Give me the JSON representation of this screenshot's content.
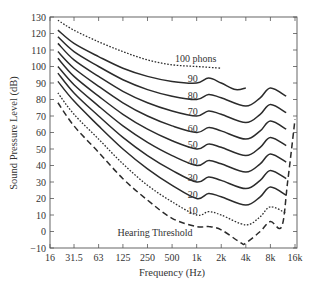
{
  "chart_data": {
    "type": "line",
    "title": "",
    "xlabel": "Frequency (Hz)",
    "ylabel": "Sound Pressure Level (dB)",
    "xscale": "log2",
    "x_ticks": [
      "16",
      "31.5",
      "63",
      "125",
      "250",
      "500",
      "1k",
      "2k",
      "4k",
      "8k",
      "16k"
    ],
    "x_tick_values": [
      16,
      31.5,
      63,
      125,
      250,
      500,
      1000,
      2000,
      4000,
      8000,
      16000
    ],
    "y_ticks": [
      130,
      120,
      110,
      100,
      90,
      80,
      70,
      60,
      50,
      40,
      30,
      20,
      10,
      0,
      -10
    ],
    "ylim": [
      -10,
      130
    ],
    "xlim": [
      16,
      16000
    ],
    "grid": false,
    "legend": "inline labels",
    "annotations": [
      {
        "text": "100 phons",
        "x": 2000,
        "y": 104
      },
      {
        "text": "Hearing Threshold",
        "x": 700,
        "y": -4
      }
    ],
    "series": [
      {
        "name": "100 phons",
        "label": "100 phons",
        "style": "dotted",
        "x": [
          20,
          31.5,
          63,
          125,
          250,
          500,
          1000,
          2000
        ],
        "values": [
          128,
          122,
          115,
          109,
          104,
          101,
          100,
          99
        ]
      },
      {
        "name": "90 phons",
        "label": "90",
        "style": "solid",
        "x": [
          20,
          31.5,
          63,
          125,
          250,
          500,
          1000,
          1400,
          2000,
          3000,
          4000
        ],
        "values": [
          122,
          114,
          106,
          99,
          94,
          91,
          90,
          93,
          90,
          86,
          87
        ]
      },
      {
        "name": "80 phons",
        "label": "80",
        "style": "solid",
        "x": [
          20,
          31.5,
          63,
          125,
          250,
          500,
          1000,
          1400,
          2000,
          4000,
          6000,
          8000,
          12500
        ],
        "values": [
          118,
          109,
          100,
          92,
          86,
          82,
          80,
          83,
          81,
          76,
          81,
          87,
          82
        ]
      },
      {
        "name": "70 phons",
        "label": "70",
        "style": "solid",
        "x": [
          20,
          31.5,
          63,
          125,
          250,
          500,
          1000,
          1400,
          2000,
          4000,
          6000,
          8000,
          12500
        ],
        "values": [
          114,
          104,
          94,
          85,
          78,
          73,
          70,
          73,
          71,
          66,
          71,
          77,
          72
        ]
      },
      {
        "name": "60 phons",
        "label": "60",
        "style": "solid",
        "x": [
          20,
          31.5,
          63,
          125,
          250,
          500,
          1000,
          1400,
          2000,
          4000,
          6000,
          8000,
          12500
        ],
        "values": [
          109,
          99,
          88,
          78,
          70,
          64,
          60,
          63,
          61,
          56,
          61,
          67,
          62
        ]
      },
      {
        "name": "50 phons",
        "label": "50",
        "style": "solid",
        "x": [
          20,
          31.5,
          63,
          125,
          250,
          500,
          1000,
          1400,
          2000,
          4000,
          6000,
          8000,
          12500
        ],
        "values": [
          105,
          94,
          82,
          71,
          62,
          55,
          50,
          53,
          51,
          46,
          51,
          57,
          52
        ]
      },
      {
        "name": "40 phons",
        "label": "40",
        "style": "solid",
        "x": [
          20,
          31.5,
          63,
          125,
          250,
          500,
          1000,
          1400,
          2000,
          4000,
          6000,
          8000,
          12500
        ],
        "values": [
          100,
          89,
          76,
          64,
          54,
          46,
          40,
          43,
          41,
          36,
          41,
          47,
          42
        ]
      },
      {
        "name": "30 phons",
        "label": "30",
        "style": "solid",
        "x": [
          20,
          31.5,
          63,
          125,
          250,
          500,
          1000,
          1400,
          2000,
          4000,
          6000,
          8000,
          12500
        ],
        "values": [
          96,
          84,
          70,
          57,
          46,
          37,
          30,
          33,
          31,
          26,
          31,
          37,
          32
        ]
      },
      {
        "name": "20 phons",
        "label": "20",
        "style": "solid",
        "x": [
          20,
          31.5,
          63,
          125,
          250,
          500,
          1000,
          1400,
          2000,
          4000,
          6000,
          8000,
          12500
        ],
        "values": [
          91,
          79,
          64,
          50,
          38,
          28,
          20,
          23,
          21,
          16,
          21,
          27,
          22
        ]
      },
      {
        "name": "10 phons",
        "label": "10",
        "style": "dotted",
        "x": [
          20,
          31.5,
          63,
          125,
          250,
          500,
          1000,
          1400,
          2000,
          4000,
          6000,
          8000,
          12500
        ],
        "values": [
          84,
          71,
          56,
          41,
          28,
          18,
          10,
          12,
          10,
          4,
          9,
          15,
          11
        ]
      },
      {
        "name": "Hearing Threshold",
        "label": "Hearing Threshold",
        "style": "dashed",
        "x": [
          20,
          31.5,
          63,
          125,
          250,
          500,
          1000,
          1400,
          2000,
          3500,
          4000,
          6000,
          8000,
          11000,
          13000,
          16000
        ],
        "values": [
          78,
          64,
          48,
          32,
          19,
          8,
          3,
          3,
          1,
          -7,
          -7,
          0,
          6,
          3,
          30,
          68
        ]
      }
    ]
  }
}
